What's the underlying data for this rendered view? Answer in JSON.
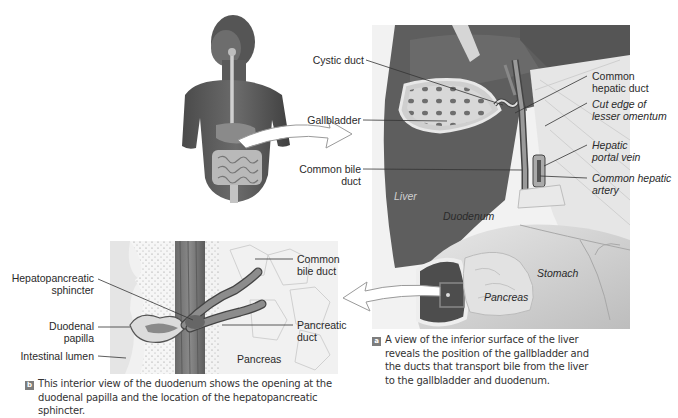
{
  "figure": {
    "panel_a": {
      "badge": "a",
      "caption_lines": [
        "A view of the inferior surface of the liver",
        "reveals the position of the gallbladder and",
        "the ducts that transport bile from the liver",
        "to the gallbladder and duodenum."
      ],
      "labels": {
        "cystic_duct": "Cystic duct",
        "gallbladder": "Gallbladder",
        "common_bile_duct_1": "Common bile",
        "common_bile_duct_2": "duct",
        "common_hepatic_duct_1": "Common",
        "common_hepatic_duct_2": "hepatic duct",
        "cut_edge_1": "Cut edge of",
        "cut_edge_2": "lesser omentum",
        "hepatic_portal_vein_1": "Hepatic",
        "hepatic_portal_vein_2": "portal vein",
        "common_hepatic_artery_1": "Common hepatic",
        "common_hepatic_artery_2": "artery",
        "liver": "Liver",
        "duodenum": "Duodenum",
        "stomach": "Stomach",
        "pancreas": "Pancreas"
      }
    },
    "panel_b": {
      "badge": "b",
      "caption_lines": [
        "This interior view of the duodenum shows the opening at the",
        "duodenal papilla and the location of the hepatopancreatic sphincter."
      ],
      "labels": {
        "hepatopancreatic_1": "Hepatopancreatic",
        "hepatopancreatic_2": "sphincter",
        "duodenal_papilla_1": "Duodenal",
        "duodenal_papilla_2": "papilla",
        "intestinal_lumen": "Intestinal lumen",
        "common_bile_duct_1": "Common",
        "common_bile_duct_2": "bile duct",
        "pancreatic_duct_1": "Pancreatic",
        "pancreatic_duct_2": "duct",
        "pancreas": "Pancreas"
      }
    },
    "colors": {
      "liver": "#5e5e5e",
      "liver_dark": "#4a4a4a",
      "badge": "#7d7d7d",
      "leader_line": "#333333"
    }
  }
}
